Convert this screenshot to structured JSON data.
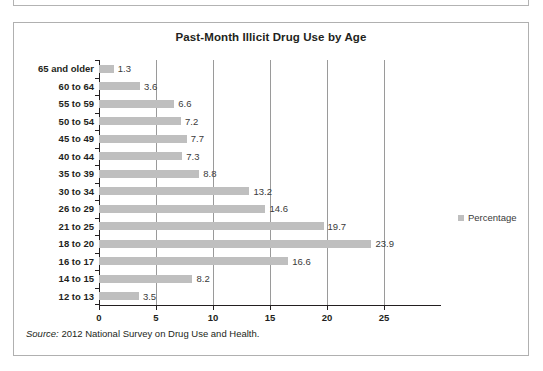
{
  "figure": {
    "title": "Past-Month Illicit Drug Use by Age",
    "source_keyword": "Source:",
    "source_text": " 2012 National Survey on Drug Use and Health."
  },
  "legend": {
    "label": "Percentage",
    "swatch_color": "#bfbfbf",
    "position": "right"
  },
  "colors": {
    "bar": "#bfbfbf",
    "gridline": "#9a9a9a",
    "axis": "#231f20",
    "frame": "#b0b0b0",
    "text": "#231f20"
  },
  "chart_data": {
    "type": "bar",
    "orientation": "horizontal",
    "title": "Past-Month Illicit Drug Use by Age",
    "xlabel": "",
    "ylabel": "",
    "xlim": [
      0,
      30
    ],
    "xticks": [
      0,
      5,
      10,
      15,
      20,
      25
    ],
    "xtick_labels": [
      "0",
      "5",
      "10",
      "15",
      "20",
      "25"
    ],
    "grid": true,
    "legend_position": "right",
    "categories": [
      "65 and older",
      "60 to 64",
      "55 to 59",
      "50 to 54",
      "45 to 49",
      "40 to 44",
      "35 to 39",
      "30 to 34",
      "26 to 29",
      "21 to 25",
      "18 to 20",
      "16 to 17",
      "14 to 15",
      "12 to 13"
    ],
    "series": [
      {
        "name": "Percentage",
        "values": [
          1.3,
          3.6,
          6.6,
          7.2,
          7.7,
          7.3,
          8.8,
          13.2,
          14.6,
          19.7,
          23.9,
          16.6,
          8.2,
          3.5
        ]
      }
    ],
    "data_labels": [
      "1.3",
      "3.6",
      "6.6",
      "7.2",
      "7.7",
      "7.3",
      "8.8",
      "13.2",
      "14.6",
      "19.7",
      "23.9",
      "16.6",
      "8.2",
      "3.5"
    ]
  }
}
